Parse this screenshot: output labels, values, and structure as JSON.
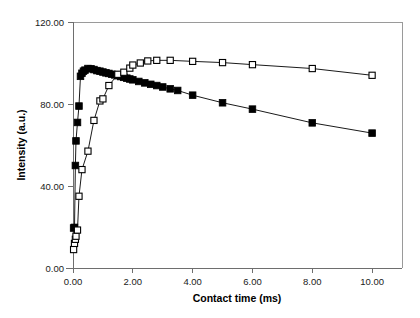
{
  "chart_data": {
    "type": "line",
    "title": "",
    "subtitle": "",
    "xlabel": "Contact time (ms)",
    "ylabel": "Intensity (a.u.)",
    "xlim": [
      0,
      11.0
    ],
    "ylim": [
      0,
      120
    ],
    "xticks": [
      0,
      2,
      4,
      6,
      8,
      10
    ],
    "xtick_labels": [
      "0.00",
      "2.00",
      "4.00",
      "6.00",
      "8.00",
      "10.00"
    ],
    "yticks": [
      0,
      40,
      80,
      120
    ],
    "ytick_labels": [
      "0.00",
      "40.00",
      "80.00",
      "120.00"
    ],
    "grid": false,
    "legend": null,
    "legend_position": "none",
    "annotations": [],
    "series": [
      {
        "name": "filled-square-series",
        "marker": "filled-square",
        "marker_color": "#000000",
        "line_color": "#000000",
        "x": [
          0.02,
          0.05,
          0.08,
          0.1,
          0.15,
          0.2,
          0.25,
          0.3,
          0.35,
          0.4,
          0.5,
          0.6,
          0.7,
          0.8,
          0.9,
          1.0,
          1.1,
          1.2,
          1.3,
          1.4,
          1.5,
          1.6,
          1.7,
          1.8,
          1.9,
          2.0,
          2.2,
          2.4,
          2.6,
          2.8,
          3.0,
          3.25,
          3.5,
          4.0,
          5.0,
          6.0,
          8.0,
          10.0
        ],
        "y": [
          19.5,
          19.8,
          50.0,
          62.0,
          71.0,
          79.0,
          93.5,
          95.0,
          96.0,
          96.5,
          97.3,
          97.2,
          96.8,
          96.3,
          96.0,
          95.6,
          95.2,
          94.9,
          94.5,
          94.2,
          93.8,
          93.4,
          93.0,
          92.6,
          92.2,
          91.8,
          91.0,
          90.3,
          89.6,
          89.0,
          88.3,
          87.4,
          86.6,
          84.3,
          80.6,
          77.5,
          70.8,
          65.8
        ]
      },
      {
        "name": "open-square-series",
        "marker": "open-square",
        "marker_color": "#ffffff",
        "line_color": "#000000",
        "x": [
          0.02,
          0.05,
          0.08,
          0.1,
          0.15,
          0.2,
          0.3,
          0.5,
          0.7,
          0.9,
          1.0,
          1.2,
          1.5,
          1.7,
          1.9,
          2.0,
          2.25,
          2.5,
          2.8,
          3.25,
          4.0,
          5.0,
          6.0,
          8.0,
          10.0
        ],
        "y": [
          9.0,
          12.0,
          14.0,
          15.5,
          18.5,
          35.0,
          48.0,
          57.0,
          72.0,
          81.5,
          82.5,
          89.0,
          94.5,
          95.5,
          97.5,
          99.0,
          100.0,
          101.0,
          101.3,
          101.3,
          100.8,
          100.2,
          99.2,
          97.3,
          94.0
        ]
      }
    ]
  }
}
